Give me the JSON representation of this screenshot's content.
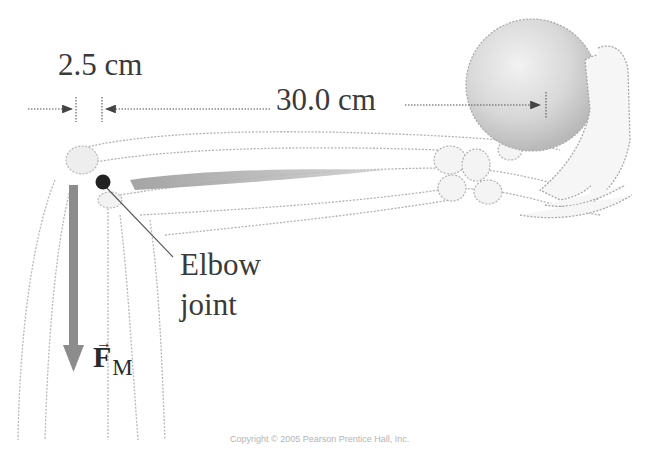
{
  "figure": {
    "dimensions": {
      "small": {
        "label": "2.5 cm",
        "value": 2.5,
        "unit": "cm",
        "meaning": "distance from elbow joint to muscle attachment"
      },
      "large": {
        "label": "30.0 cm",
        "value": 30.0,
        "unit": "cm",
        "meaning": "distance from muscle attachment to ball center"
      }
    },
    "annotations": {
      "elbow_line1": "Elbow",
      "elbow_line2": "joint",
      "force_symbol": "F",
      "force_subscript": "M",
      "force_vector_mark": "→"
    },
    "copyright": "Copyright © 2005 Pearson Prentice Hall, Inc.",
    "colors": {
      "text": "#3a3a3a",
      "force_arrow": "#8a8a8a",
      "ball": "#cfcfcf",
      "outline": "#b0b0b0",
      "joint_dot": "#222222"
    }
  }
}
